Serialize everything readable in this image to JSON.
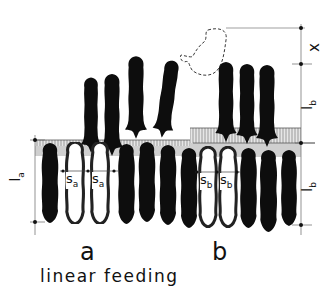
{
  "diagram": {
    "caption": "linear feeding",
    "panels": [
      {
        "id": "a",
        "label": "a",
        "spacing_label": "s",
        "spacing_subscript": "a",
        "length_label": "l",
        "length_subscript": "a"
      },
      {
        "id": "b",
        "label": "b",
        "spacing_label": "s",
        "spacing_subscript": "b",
        "length_label": "l",
        "length_subscript": "b"
      }
    ],
    "dimensions": {
      "left": {
        "label": "la"
      },
      "right": [
        {
          "label": "x"
        },
        {
          "label": "lb"
        },
        {
          "label": "lb"
        }
      ]
    },
    "colors": {
      "animal": "#0d0d0d",
      "outline": "#222222",
      "trough": "#c9c9c9",
      "line": "#555555",
      "background": "#ffffff"
    }
  }
}
